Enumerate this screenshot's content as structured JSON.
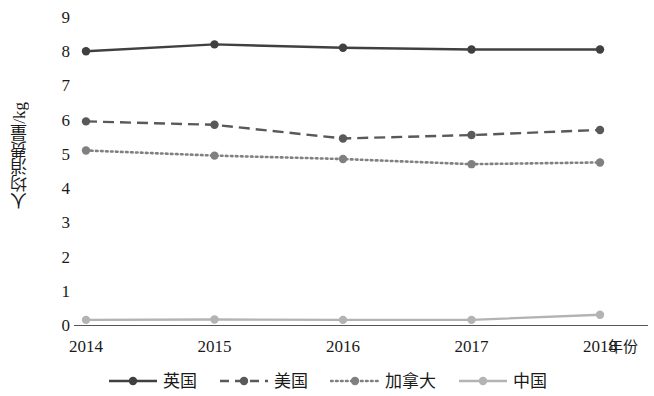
{
  "chart_data": {
    "type": "line",
    "title": "",
    "xlabel": "年份",
    "ylabel": "人均消费量/kg",
    "categories": [
      "2014",
      "2015",
      "2016",
      "2017",
      "2018"
    ],
    "ylim": [
      0,
      9
    ],
    "yticks": [
      "0",
      "1",
      "2",
      "3",
      "4",
      "5",
      "6",
      "7",
      "8",
      "9"
    ],
    "grid": false,
    "legend_position": "bottom",
    "series": [
      {
        "name": "英国",
        "color": "#404040",
        "style": "solid",
        "marker": "circle",
        "values": [
          8.0,
          8.2,
          8.1,
          8.05,
          8.05
        ]
      },
      {
        "name": "美国",
        "color": "#595959",
        "style": "dashed",
        "marker": "circle",
        "values": [
          5.95,
          5.85,
          5.45,
          5.55,
          5.7
        ]
      },
      {
        "name": "加拿大",
        "color": "#808080",
        "style": "dotted",
        "marker": "circle",
        "values": [
          5.1,
          4.95,
          4.85,
          4.7,
          4.75
        ]
      },
      {
        "name": "中国",
        "color": "#b3b3b3",
        "style": "solid",
        "marker": "circle",
        "values": [
          0.15,
          0.16,
          0.15,
          0.15,
          0.3
        ]
      }
    ]
  },
  "axis": {
    "y_label_text": "人均消费量/kg",
    "x_label_text": "年份"
  },
  "legend": {
    "items": [
      {
        "label": "英国"
      },
      {
        "label": "美国"
      },
      {
        "label": "加拿大"
      },
      {
        "label": "中国"
      }
    ]
  }
}
